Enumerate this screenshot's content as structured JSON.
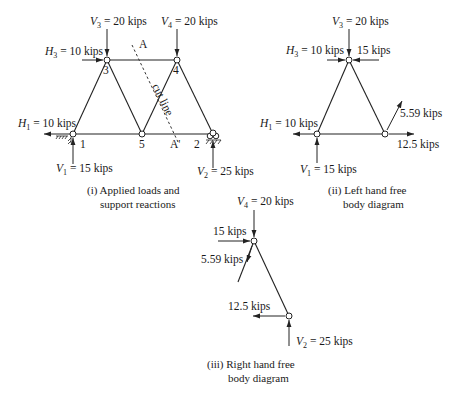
{
  "figure_i": {
    "caption_line1": "(i) Applied loads and",
    "caption_line2": "support reactions",
    "nodes": {
      "n1": "1",
      "n2": "2",
      "n3": "3",
      "n4": "4",
      "n5": "5"
    },
    "loads": {
      "V3": {
        "sym": "V",
        "sub": "3",
        "val": " = 20 kips"
      },
      "V4": {
        "sym": "V",
        "sub": "4",
        "val": " = 20 kips"
      },
      "H3": {
        "sym": "H",
        "sub": "3",
        "val": " = 10 kips"
      },
      "H1": {
        "sym": "H",
        "sub": "1",
        "val": " = 10 kips"
      },
      "V1": {
        "sym": "V",
        "sub": "1",
        "val": " = 15 kips"
      },
      "V2": {
        "sym": "V",
        "sub": "2",
        "val": " = 25 kips"
      }
    },
    "cut": {
      "label": "cut line",
      "top": "A",
      "bottom": "A'"
    }
  },
  "figure_ii": {
    "caption_line1": "(ii) Left hand free",
    "caption_line2": "body diagram",
    "loads": {
      "V3": {
        "sym": "V",
        "sub": "3",
        "val": " = 20 kips"
      },
      "H3": {
        "sym": "H",
        "sub": "3",
        "val": " = 10 kips"
      },
      "F34": "15 kips",
      "H1": {
        "sym": "H",
        "sub": "1",
        "val": " = 10 kips"
      },
      "F54": "5.59 kips",
      "F52": "12.5 kips",
      "V1": {
        "sym": "V",
        "sub": "1",
        "val": " = 15 kips"
      }
    }
  },
  "figure_iii": {
    "caption_line1": "(iii) Right hand free",
    "caption_line2": "body diagram",
    "loads": {
      "V4": {
        "sym": "V",
        "sub": "4",
        "val": " = 20 kips"
      },
      "F43": "15 kips",
      "F45": "5.59 kips",
      "F25": "12.5 kips",
      "V2": {
        "sym": "V",
        "sub": "2",
        "val": " = 25 kips"
      }
    }
  }
}
